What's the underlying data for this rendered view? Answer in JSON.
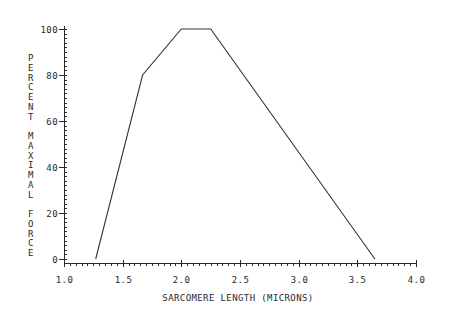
{
  "chart_data": {
    "type": "line",
    "title": "",
    "xlabel": "SARCOMERE LENGTH (MICRONS)",
    "ylabel": "PERCENT MAXIMAL FORCE",
    "xlim": [
      1.0,
      4.0
    ],
    "ylim": [
      0,
      100
    ],
    "xticks": [
      1.0,
      1.5,
      2.0,
      2.5,
      3.0,
      3.5,
      4.0
    ],
    "xtick_labels": [
      "1.0",
      "1.5",
      "2.0",
      "2.5",
      "3.0",
      "3.5",
      "4.0"
    ],
    "yticks": [
      0,
      20,
      40,
      60,
      80,
      100
    ],
    "ytick_labels": [
      "0",
      "20",
      "40",
      "60",
      "80",
      "100"
    ],
    "x_minor_step": 0.05,
    "y_minor_step": 2,
    "grid": false,
    "legend": null,
    "series": [
      {
        "name": "length-tension curve",
        "x": [
          1.27,
          1.67,
          2.0,
          2.25,
          3.65
        ],
        "y": [
          0,
          80,
          100,
          100,
          0
        ]
      }
    ],
    "colors": {
      "line": "#333333",
      "axis": "#2a2a2a",
      "background": "#ffffff"
    }
  }
}
